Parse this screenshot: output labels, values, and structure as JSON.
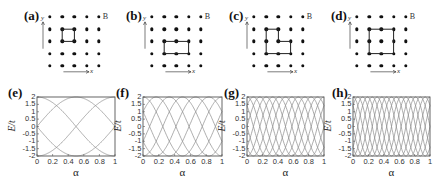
{
  "lattice_panels": [
    {
      "label": "(a)",
      "field_label": "B",
      "x_axis_label": "x",
      "y_axis_label": "y",
      "loop": [
        [
          1,
          1
        ],
        [
          2,
          1
        ],
        [
          2,
          2
        ],
        [
          1,
          2
        ],
        [
          1,
          1
        ]
      ],
      "loop_desc": "single plaquette (1x1 square)"
    },
    {
      "label": "(b)",
      "field_label": "B",
      "x_axis_label": "x",
      "y_axis_label": "y",
      "loop": [
        [
          1,
          2
        ],
        [
          3,
          2
        ],
        [
          3,
          3
        ],
        [
          1,
          3
        ],
        [
          1,
          2
        ]
      ],
      "loop_desc": "2x1 rectangle"
    },
    {
      "label": "(c)",
      "field_label": "B",
      "x_axis_label": "x",
      "y_axis_label": "y",
      "loop": [
        [
          1,
          1
        ],
        [
          2,
          1
        ],
        [
          2,
          2
        ],
        [
          3,
          2
        ],
        [
          3,
          3
        ],
        [
          1,
          3
        ],
        [
          1,
          1
        ]
      ],
      "loop_desc": "L-shaped loop (3 plaquettes)"
    },
    {
      "label": "(d)",
      "field_label": "B",
      "x_axis_label": "x",
      "y_axis_label": "y",
      "loop": [
        [
          1,
          1
        ],
        [
          3,
          1
        ],
        [
          3,
          3
        ],
        [
          1,
          3
        ],
        [
          1,
          1
        ]
      ],
      "loop_desc": "2x2 square"
    }
  ],
  "chart_data": [
    {
      "type": "line",
      "label": "(e)",
      "xlabel": "α",
      "ylabel": "E/t",
      "xlim": [
        0,
        1
      ],
      "ylim": [
        -2,
        2
      ],
      "xticks": [
        "0",
        "0.2",
        "0.4",
        "0.6",
        "0.8",
        "1"
      ],
      "yticks": [
        "2",
        "1.5",
        "1",
        "0.5",
        "0",
        "-0.5",
        "-1",
        "-1.5",
        "-2"
      ],
      "flux_area": 1,
      "n_curves": 4,
      "grid": false
    },
    {
      "type": "line",
      "label": "(f)",
      "xlabel": "α",
      "ylabel": "E/t",
      "xlim": [
        0,
        1
      ],
      "ylim": [
        -2,
        2
      ],
      "xticks": [
        "0",
        "0.2",
        "0.4",
        "0.6",
        "0.8",
        "1"
      ],
      "yticks": [
        "2",
        "1.5",
        "1",
        "0.5",
        "0",
        "-0.5",
        "-1",
        "-1.5",
        "-2"
      ],
      "flux_area": 2,
      "n_curves": 6,
      "grid": false
    },
    {
      "type": "line",
      "label": "(g)",
      "xlabel": "α",
      "ylabel": "E/t",
      "xlim": [
        0,
        1
      ],
      "ylim": [
        -2,
        2
      ],
      "xticks": [
        "0",
        "0.2",
        "0.4",
        "0.6",
        "0.8",
        "1"
      ],
      "yticks": [
        "2",
        "1.5",
        "1",
        "0.5",
        "0",
        "-0.5",
        "-1",
        "-1.5",
        "-2"
      ],
      "flux_area": 3,
      "n_curves": 8,
      "grid": false
    },
    {
      "type": "line",
      "label": "(h)",
      "xlabel": "α",
      "ylabel": "E/t",
      "xlim": [
        0,
        1
      ],
      "ylim": [
        -2,
        2
      ],
      "xticks": [
        "0",
        "0.2",
        "0.4",
        "0.6",
        "0.8",
        "1"
      ],
      "yticks": [
        "2",
        "1.5",
        "1",
        "0.5",
        "0",
        "-0.5",
        "-1",
        "-1.5",
        "-2"
      ],
      "flux_area": 4,
      "n_curves": 8,
      "grid": false
    }
  ],
  "colors": {
    "curve": "#8a8a8a",
    "frame": "#555555",
    "dot": "#111111"
  }
}
